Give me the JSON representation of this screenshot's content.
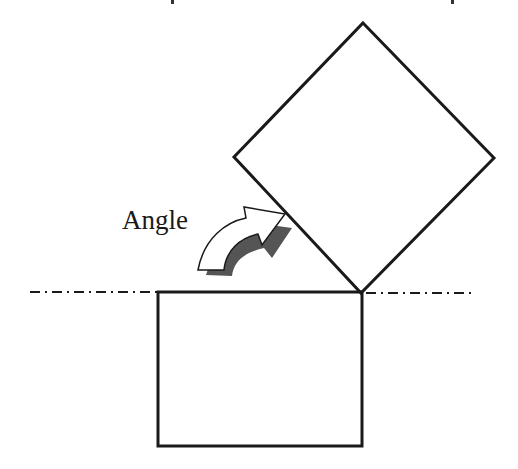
{
  "diagram": {
    "label": "Angle",
    "colors": {
      "stroke": "#1a1a1a",
      "arrow_fill": "#ffffff",
      "arrow_shadow": "#555555",
      "background": "#ffffff"
    },
    "elements": [
      {
        "name": "reference-line",
        "type": "dash-dot line",
        "y": 292,
        "x_start": 30,
        "x_end": 475
      },
      {
        "name": "base-rectangle",
        "type": "rectangle",
        "x": 158,
        "y": 292,
        "width": 204,
        "height": 154
      },
      {
        "name": "rotated-square",
        "type": "square rotated ~45°",
        "vertices": [
          [
            363,
            23
          ],
          [
            494,
            158
          ],
          [
            361,
            293
          ],
          [
            234,
            157
          ]
        ]
      },
      {
        "name": "rotation-arrow",
        "type": "curved arrow",
        "direction": "clockwise",
        "label": "Angle"
      }
    ]
  }
}
